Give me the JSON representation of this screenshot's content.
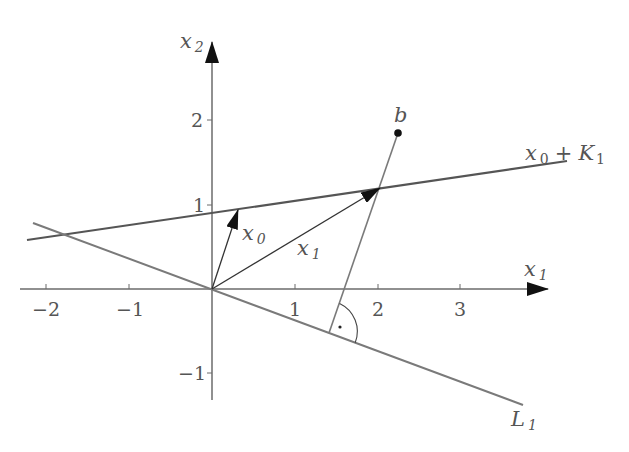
{
  "diagram": {
    "type": "geometry-projection",
    "colors": {
      "axis": "#6b6b6b",
      "line_dark": "#555555",
      "line_gray": "#7a7a7a",
      "vector": "#333333",
      "arrowhead": "#111111",
      "point": "#111111",
      "text": "#555555"
    },
    "axes": {
      "x_label": {
        "main": "x",
        "sub": "1"
      },
      "y_label": {
        "main": "x",
        "sub": "2"
      },
      "x_ticks": [
        "−2",
        "−1",
        "1",
        "2",
        "3"
      ],
      "y_ticks": [
        "2",
        "1",
        "−1"
      ]
    },
    "labels": {
      "b": "b",
      "x0": {
        "main": "x",
        "sub": "0"
      },
      "x1": {
        "main": "x",
        "sub": "1"
      },
      "affine": {
        "main": "x",
        "sub": "0",
        "plus": "+",
        "K": "K",
        "Ksub": "1"
      },
      "L1": {
        "main": "L",
        "sub": "1"
      },
      "right_angle_dot": "·"
    },
    "geometry": {
      "origin": [
        0,
        0
      ],
      "x0": [
        0.31,
        0.94
      ],
      "x1": [
        2.02,
        1.22
      ],
      "b": [
        2.24,
        1.86
      ],
      "foot_of_perpendicular": [
        1.41,
        -0.52
      ]
    }
  }
}
